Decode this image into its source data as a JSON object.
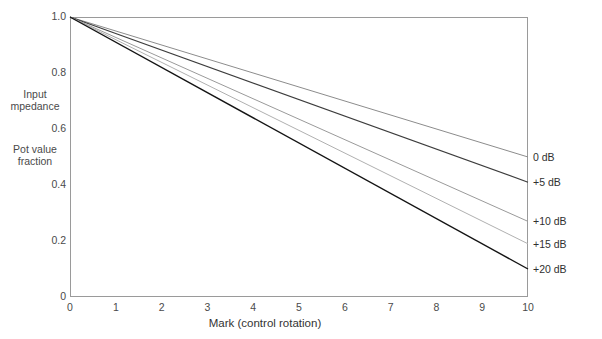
{
  "chart_data": {
    "type": "line",
    "title": "",
    "xlabel": "Mark  (control rotation)",
    "ylabel_blocks": [
      {
        "line1": "Input",
        "line2": "mpedance"
      },
      {
        "line1": "Pot value",
        "line2": "fraction"
      }
    ],
    "xlim": [
      0,
      10
    ],
    "ylim": [
      0,
      1.0
    ],
    "xticks": [
      "0",
      "1",
      "2",
      "3",
      "4",
      "5",
      "6",
      "7",
      "8",
      "9",
      "10"
    ],
    "xtick_values": [
      0,
      1,
      2,
      3,
      4,
      5,
      6,
      7,
      8,
      9,
      10
    ],
    "yticks": [
      "0",
      "0.2",
      "0.4",
      "0.6",
      "0.8",
      "1.0"
    ],
    "ytick_values": [
      0,
      0.2,
      0.4,
      0.6,
      0.8,
      1.0
    ],
    "grid": false,
    "legend_position": "right-outside",
    "series": [
      {
        "name": "0 dB",
        "color": "#8c8c8c",
        "width": 1.0,
        "x": [
          0,
          10
        ],
        "values": [
          1.0,
          0.5
        ]
      },
      {
        "name": "+5 dB",
        "color": "#3d3d3d",
        "width": 1.2,
        "x": [
          0,
          10
        ],
        "values": [
          1.0,
          0.41
        ]
      },
      {
        "name": "+10 dB",
        "color": "#9a9a9a",
        "width": 1.0,
        "x": [
          0,
          10
        ],
        "values": [
          1.0,
          0.27
        ]
      },
      {
        "name": "+15 dB",
        "color": "#b0b0b0",
        "width": 1.0,
        "x": [
          0,
          10
        ],
        "values": [
          1.0,
          0.19
        ]
      },
      {
        "name": "+20 dB",
        "color": "#141414",
        "width": 1.4,
        "x": [
          0,
          10
        ],
        "values": [
          1.0,
          0.1
        ]
      }
    ]
  },
  "figure": {
    "background": "#ffffff",
    "frame_color": "#9a9a9a",
    "text_color": "#4a4a4a"
  }
}
